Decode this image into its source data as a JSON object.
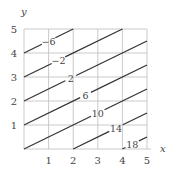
{
  "chart_data": {
    "type": "contour",
    "title": "",
    "xlabel": "x",
    "ylabel": "y",
    "xlim": [
      0,
      5
    ],
    "ylim": [
      0,
      5
    ],
    "grid": true,
    "function": "f(x,y) = 2x - 4y + 10",
    "x_ticks": [
      "1",
      "2",
      "3",
      "4",
      "5"
    ],
    "y_ticks": [
      "1",
      "2",
      "3",
      "4",
      "5"
    ],
    "contours": [
      {
        "level": -6,
        "label": "−6",
        "from": [
          0,
          4
        ],
        "to": [
          2,
          5
        ],
        "label_at": [
          1.0,
          4.5
        ]
      },
      {
        "level": -2,
        "label": "−2",
        "from": [
          0,
          3
        ],
        "to": [
          4,
          5
        ],
        "label_at": [
          1.4,
          3.7
        ]
      },
      {
        "level": 2,
        "label": "2",
        "from": [
          0,
          2
        ],
        "to": [
          5,
          4.5
        ],
        "label_at": [
          1.9,
          2.95
        ]
      },
      {
        "level": 6,
        "label": "6",
        "from": [
          0,
          1
        ],
        "to": [
          5,
          3.5
        ],
        "label_at": [
          2.5,
          2.25
        ]
      },
      {
        "level": 10,
        "label": "10",
        "from": [
          0,
          0
        ],
        "to": [
          5,
          2.5
        ],
        "label_at": [
          3.0,
          1.5
        ]
      },
      {
        "level": 14,
        "label": "14",
        "from": [
          2,
          0
        ],
        "to": [
          5,
          1.5
        ],
        "label_at": [
          3.75,
          0.85
        ]
      },
      {
        "level": 18,
        "label": "18",
        "from": [
          4,
          0
        ],
        "to": [
          5,
          0.5
        ],
        "label_at": [
          4.4,
          0.2
        ]
      }
    ]
  }
}
